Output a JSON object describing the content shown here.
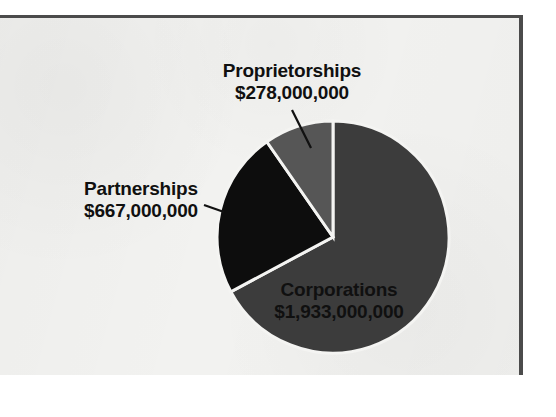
{
  "figure": {
    "name": "business-receipts-pie-chart",
    "background_color": "#f2f2f0",
    "frame_color": "#4b4b4b"
  },
  "chart_data": {
    "type": "pie",
    "title": "",
    "subtitle": "",
    "xlabel": "",
    "ylabel": "",
    "legend_position": "none",
    "grid": false,
    "units": "US dollars",
    "total": 2878000000,
    "categories": [
      "Corporations",
      "Partnerships",
      "Proprietorships"
    ],
    "values": [
      1933000000,
      667000000,
      278000000
    ],
    "value_labels": [
      "$1,933,000,000",
      "$667,000,000",
      "$278,000,000"
    ],
    "percentages": [
      67.2,
      23.2,
      9.7
    ],
    "start_angle_deg": 0,
    "direction": "clockwise",
    "slices": [
      {
        "label": "Corporations",
        "value": 1933000000,
        "value_label": "$1,933,000,000",
        "percent": 67.2,
        "start_deg": 0,
        "end_deg": 241.8,
        "color": "#3c3c3c",
        "label_placement": "inside",
        "label_color": "#101010"
      },
      {
        "label": "Partnerships",
        "value": 667000000,
        "value_label": "$667,000,000",
        "percent": 23.2,
        "start_deg": 241.8,
        "end_deg": 325.2,
        "color": "#0d0d0d",
        "label_placement": "outside-left",
        "label_color": "#101010"
      },
      {
        "label": "Proprietorships",
        "value": 278000000,
        "value_label": "$278,000,000",
        "percent": 9.7,
        "start_deg": 325.2,
        "end_deg": 360,
        "color": "#565656",
        "label_placement": "outside-top",
        "label_color": "#101010"
      }
    ],
    "slice_separator_color": "#f4f4f2",
    "leader_line_color": "#111111",
    "center": {
      "x": 333,
      "y": 237
    },
    "radius": 116
  },
  "labels": {
    "proprietorships": {
      "category": "Proprietorships",
      "amount": "$278,000,000"
    },
    "partnerships": {
      "category": "Partnerships",
      "amount": "$667,000,000"
    },
    "corporations": {
      "category": "Corporations",
      "amount": "$1,933,000,000"
    }
  }
}
